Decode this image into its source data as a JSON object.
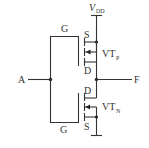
{
  "diagram": {
    "type": "circuit-schematic",
    "supply": {
      "label": "V",
      "subscript": "DD"
    },
    "input": {
      "label": "A"
    },
    "output": {
      "label": "F"
    },
    "transistors": [
      {
        "id": "pmos",
        "label": "VT",
        "subscript": "P",
        "gate": "G",
        "source": "S",
        "drain": "D"
      },
      {
        "id": "nmos",
        "label": "VT",
        "subscript": "N",
        "gate": "G",
        "source": "S",
        "drain": "D"
      }
    ],
    "colors": {
      "line": "#333333",
      "background": "#ffffff"
    }
  }
}
